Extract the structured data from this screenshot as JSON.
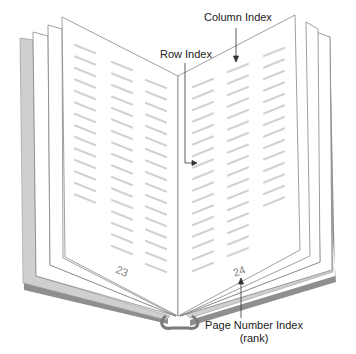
{
  "diagram": {
    "type": "open-book-illustration",
    "labels": {
      "column_index": "Column Index",
      "row_index": "Row Index",
      "page_number_index_line1": "Page Number Index",
      "page_number_index_line2": "(rank)"
    },
    "pages": {
      "left_page_number": "23",
      "right_page_number": "24"
    },
    "colors": {
      "cover": "#c8c8c8",
      "cover_edge": "#8a8a8a",
      "page_outline": "#777777",
      "text_lines": "#d2d2d2",
      "arrow": "#333333"
    }
  }
}
